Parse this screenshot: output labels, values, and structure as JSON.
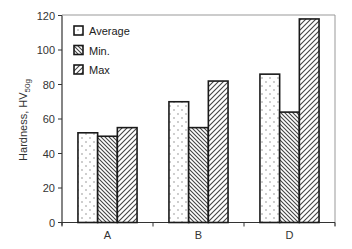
{
  "chart_data": {
    "type": "bar",
    "title": "",
    "xlabel": "",
    "ylabel": "Hardness, HV",
    "ylabel_subscript": "50g",
    "categories": [
      "A",
      "B",
      "D"
    ],
    "series": [
      {
        "name": "Average",
        "pattern": "dots",
        "values": [
          52,
          70,
          86
        ]
      },
      {
        "name": "Min.",
        "pattern": "diagonal-back",
        "values": [
          50,
          55,
          64
        ]
      },
      {
        "name": "Max",
        "pattern": "diagonal-forward",
        "values": [
          55,
          82,
          118
        ]
      }
    ],
    "ylim": [
      0,
      120
    ],
    "yticks": [
      0,
      20,
      40,
      60,
      80,
      100,
      120
    ],
    "grid": false,
    "legend_position": "upper-left (inside plot)",
    "frame": true
  },
  "colors": {
    "axis": "#333333",
    "frame": "#999999",
    "bar_outline": "#1a1a1a",
    "pattern": "#555555"
  }
}
